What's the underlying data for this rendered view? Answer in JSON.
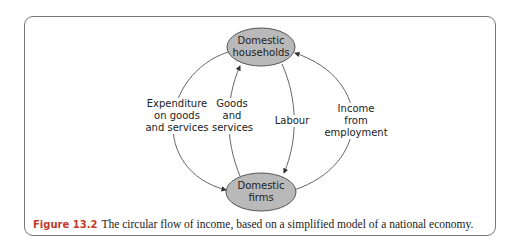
{
  "figure": {
    "nodes": {
      "households": {
        "line1": "Domestic",
        "line2": "households"
      },
      "firms": {
        "line1": "Domestic",
        "line2": "firms"
      }
    },
    "flows": [
      {
        "label_lines": [
          "Expenditure",
          "on goods",
          "and services"
        ],
        "from": "households",
        "to": "firms"
      },
      {
        "label_lines": [
          "Goods",
          "and",
          "services"
        ],
        "from": "firms",
        "to": "households"
      },
      {
        "label_lines": [
          "Labour"
        ],
        "from": "households",
        "to": "firms"
      },
      {
        "label_lines": [
          "Income",
          "from",
          "employment"
        ],
        "from": "firms",
        "to": "households"
      }
    ],
    "caption": {
      "number": "Figure 13.2",
      "text": "The circular flow of income, based on a simplified model of a national economy."
    },
    "colors": {
      "node_fill": "#b9b9b9",
      "stroke": "#555555",
      "caption_number": "#c0392b"
    }
  }
}
